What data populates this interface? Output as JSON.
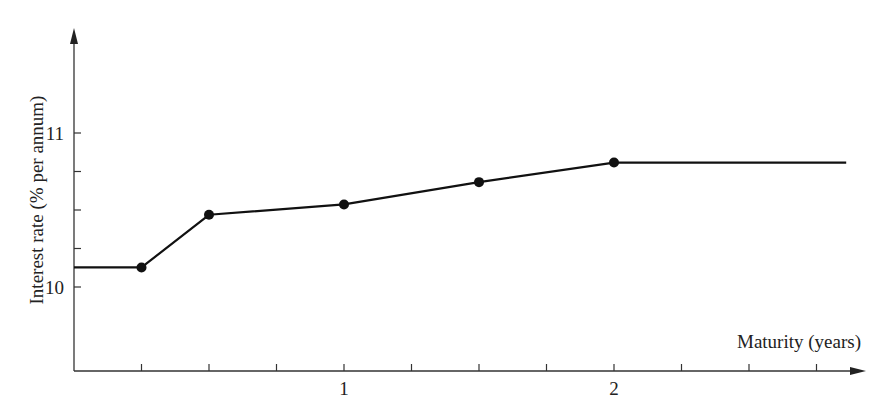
{
  "chart_data": {
    "type": "line",
    "title": "",
    "xlabel": "Maturity (years)",
    "ylabel": "Interest rate (% per annum)",
    "xlim": [
      0,
      2.9
    ],
    "ylim": [
      9.55,
      11.5
    ],
    "x_ticks": [
      0.25,
      0.5,
      0.75,
      1,
      1.25,
      1.5,
      1.75,
      2,
      2.25,
      2.5,
      2.75
    ],
    "x_tick_labels": [
      {
        "value": 1,
        "label": "1"
      },
      {
        "value": 2,
        "label": "2"
      }
    ],
    "y_ticks": [
      10,
      10.25,
      10.5,
      10.75,
      11
    ],
    "y_tick_labels": [
      {
        "value": 10,
        "label": "10"
      },
      {
        "value": 11,
        "label": "11"
      }
    ],
    "grid": false,
    "legend": null,
    "series": [
      {
        "name": "Zero curve",
        "points": [
          {
            "x": 0.25,
            "y": 10.127
          },
          {
            "x": 0.5,
            "y": 10.469
          },
          {
            "x": 1.0,
            "y": 10.536
          },
          {
            "x": 1.5,
            "y": 10.681
          },
          {
            "x": 2.0,
            "y": 10.808
          }
        ],
        "extend_left_to": 0,
        "extend_right_to": 2.86,
        "color": "#111111"
      }
    ]
  },
  "labels": {
    "xlabel": "Maturity (years)",
    "ylabel": "Interest rate (% per annum)"
  }
}
